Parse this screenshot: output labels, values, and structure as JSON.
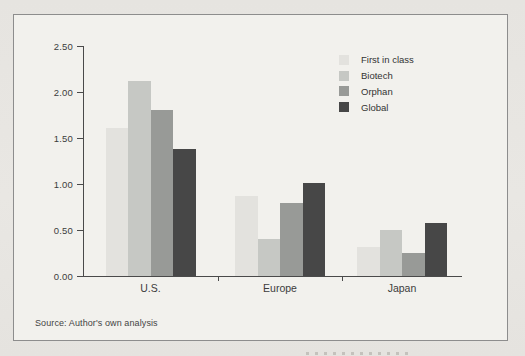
{
  "source_note": "Source: Author's own analysis",
  "colors": {
    "first_in_class": "#e3e2de",
    "biotech": "#c6c8c4",
    "orphan": "#989a97",
    "global": "#474747",
    "axis": "#4a4a4a",
    "frame_border": "#8d8d8d",
    "frame_background": "#f2f1ed",
    "page_background": "#e7e5e1"
  },
  "chart_data": {
    "type": "bar",
    "categories": [
      "U.S.",
      "Europe",
      "Japan"
    ],
    "series": [
      {
        "name": "First in class",
        "color": "#e3e2de",
        "values": [
          1.61,
          0.87,
          0.31
        ]
      },
      {
        "name": "Biotech",
        "color": "#c6c8c4",
        "values": [
          2.12,
          0.4,
          0.5
        ]
      },
      {
        "name": "Orphan",
        "color": "#989a97",
        "values": [
          1.8,
          0.79,
          0.25
        ]
      },
      {
        "name": "Global",
        "color": "#474747",
        "values": [
          1.38,
          1.01,
          0.58
        ]
      }
    ],
    "title": "",
    "xlabel": "",
    "ylabel": "",
    "ylim": [
      0,
      2.5
    ],
    "yticks": [
      0,
      0.5,
      1.0,
      1.5,
      2.0,
      2.5
    ],
    "ytick_format_decimals": 2,
    "grid": false,
    "legend_position": "top-right"
  }
}
